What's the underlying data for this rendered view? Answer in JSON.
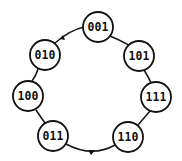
{
  "diagram": {
    "type": "state-cycle",
    "nodes": [
      {
        "id": "n001",
        "label": "001",
        "cx": 98,
        "cy": 27,
        "r": 15
      },
      {
        "id": "n101",
        "label": "101",
        "cx": 139,
        "cy": 56,
        "r": 15
      },
      {
        "id": "n111",
        "label": "111",
        "cx": 156,
        "cy": 97,
        "r": 15
      },
      {
        "id": "n110",
        "label": "110",
        "cx": 128,
        "cy": 137,
        "r": 15
      },
      {
        "id": "n011",
        "label": "011",
        "cx": 53,
        "cy": 136,
        "r": 15
      },
      {
        "id": "n100",
        "label": "100",
        "cx": 28,
        "cy": 96,
        "r": 15
      },
      {
        "id": "n010",
        "label": "010",
        "cx": 45,
        "cy": 55,
        "r": 15
      }
    ],
    "edges": [
      {
        "from": "001",
        "to": "101"
      },
      {
        "from": "101",
        "to": "111"
      },
      {
        "from": "111",
        "to": "110"
      },
      {
        "from": "110",
        "to": "011"
      },
      {
        "from": "011",
        "to": "100"
      },
      {
        "from": "100",
        "to": "010"
      },
      {
        "from": "010",
        "to": "001"
      }
    ],
    "colors": {
      "stroke": "#111111",
      "fill": "#ffffff",
      "background": "#ffffff"
    }
  }
}
